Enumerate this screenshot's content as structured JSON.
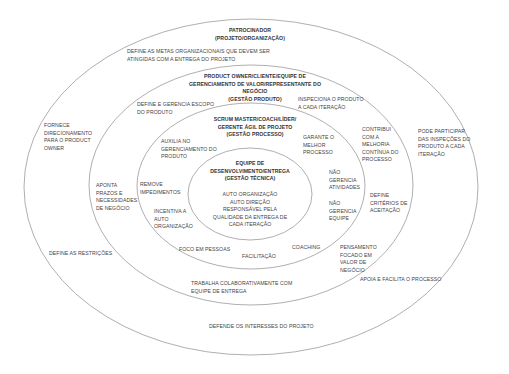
{
  "diagram": {
    "type": "concentric-ellipses",
    "colors": {
      "background": "#ffffff",
      "ring_stroke": "#9a9a9a",
      "text": "#444444"
    },
    "rings": [
      {
        "id": "sponsor",
        "title": "PATROCINADOR\n(PROJETO/ORGANIZAÇÃO)",
        "responsibilities": {
          "top": "DEFINE AS METAS ORGANIZACIONAIS QUE DEVEM SER\nATINGIDAS COM A ENTREGA DO PROJETO",
          "left_top": "FORNECE\nDIRECIONAMENTO\nPARA O PRODUCT\nOWNER",
          "right_top": "PODE PARTICIPAR\nDAS INSPEÇÕES DO\nPRODUTO A CADA\nITERAÇÃO",
          "left_bottom": "DEFINE AS RESTRIÇÕES",
          "right_bottom": "APOIA E FACILITA O PROCESSO",
          "bottom": "DEFENDE OS INTERESSES DO PROJETO"
        }
      },
      {
        "id": "product-owner",
        "title": "PRODUCT OWNER/CLIENTE/EQUIPE DE\nGERENCIAMENTO DE VALOR/REPRESENTANTE DO\nNEGÓCIO\n(GESTÃO PRODUTO)",
        "responsibilities": {
          "left_top": "DEFINE E GERENCIA ESCOPO\nDO PRODUTO",
          "right_top": "INSPECIONA O PRODUTO\nA CADA ITERAÇÃO",
          "right_mid": "CONTRIBUI\nCOM A\nMELHORIA\nCONTÍNUA DO\nPROCESSO",
          "left_mid": "APONTA\nPRAZOS E\nNECESSIDADES\nDE NEGÓCIO",
          "right_lower": "DEFINE\nCRITÉRIOS DE\nACEITAÇÃO",
          "right_bottom": "PENSAMENTO\nFOCADO EM\nVALOR DE\nNEGÓCIO",
          "bottom": "TRABALHA COLABORATIVAMENTE COM\nEQUIPE DE ENTREGA"
        }
      },
      {
        "id": "scrum-master",
        "title": "SCRUM MASTER/COACH/LÍDER/\nGERENTE ÁGIL DE PROJETO\n(GESTÃO PROCESSO)",
        "responsibilities": {
          "left_top": "AUXILIA NO\nGERENCIAMENTO DO\nPRODUTO",
          "right_top": "GARANTE O\nMELHOR\nPROCESSO",
          "left_mid": "REMOVE\nIMPEDIMENTOS",
          "left_lower": "INCENTIVA A\nAUTO\nORGANIZAÇÃO",
          "right_mid": "NÃO\nGERENCIA\nATIVIDADES",
          "right_lower": "NÃO\nGERENCIA\nEQUIPE",
          "bottom_left": "FOCO EM PESSOAS",
          "bottom": "FACILITAÇÃO",
          "bottom_right": "COACHING"
        }
      },
      {
        "id": "dev-team",
        "title": "EQUIPE DE\nDESENVOLVIMENTO/ENTREGA\n(GESTÃO TÉCNICA)",
        "responsibilities": {
          "center": "AUTO ORGANIZAÇÃO\nAUTO DIREÇÃO\nRESPONSÁVEL PELA\nQUALIDADE DA ENTREGA DE\nCADA ITERAÇÃO"
        }
      }
    ]
  }
}
